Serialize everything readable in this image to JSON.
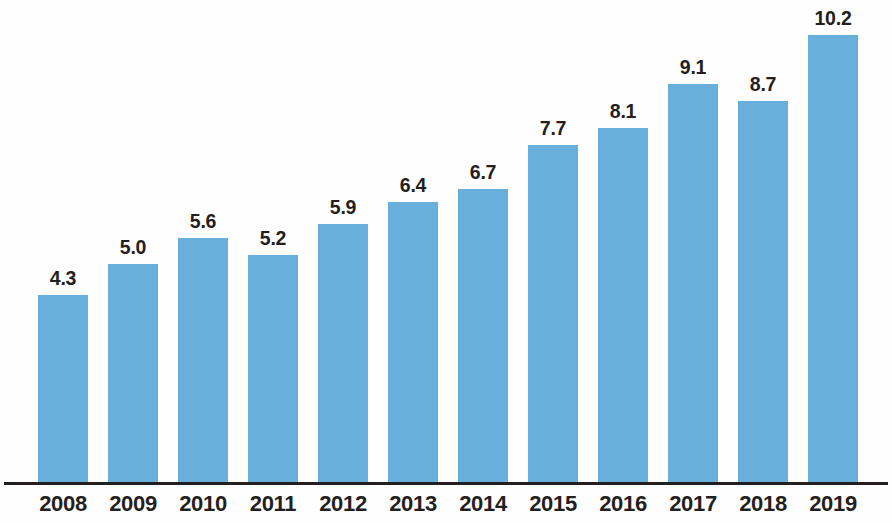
{
  "chart_data": {
    "type": "bar",
    "title": "",
    "subtitle": "",
    "xlabel": "",
    "ylabel": "",
    "categories": [
      "2008",
      "2009",
      "2010",
      "2011",
      "2012",
      "2013",
      "2014",
      "2015",
      "2016",
      "2017",
      "2018",
      "2019"
    ],
    "values": [
      4.3,
      5.0,
      5.6,
      5.2,
      5.9,
      6.4,
      6.7,
      7.7,
      8.1,
      9.1,
      8.7,
      10.2
    ],
    "data_labels": [
      "4.3",
      "5.0",
      "5.6",
      "5.2",
      "5.9",
      "6.4",
      "6.7",
      "7.7",
      "8.1",
      "9.1",
      "8.7",
      "10.2"
    ],
    "ylim": [
      0,
      10.2
    ],
    "grid": false,
    "legend": null,
    "legend_position": "none",
    "bar_color": "#69afdc",
    "axis_color": "#231f20",
    "label_color": "#231f20",
    "background_color": "#fefefe",
    "annotations": []
  }
}
